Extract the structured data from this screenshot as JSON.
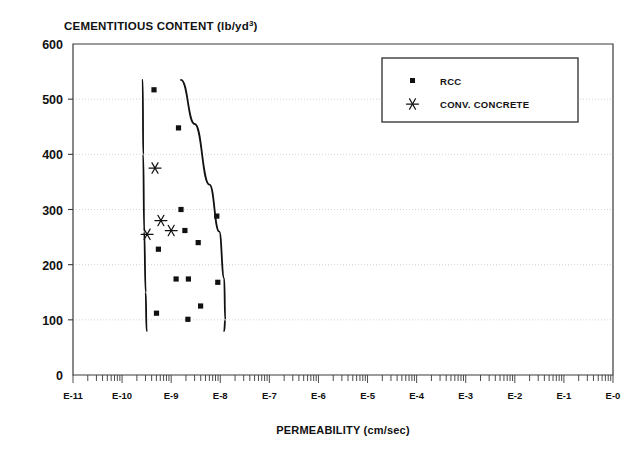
{
  "chart_data": {
    "type": "scatter",
    "title": "CEMENTITIOUS CONTENT (lb/yd3)",
    "title_main": "CEMENTITIOUS CONTENT (lb/yd",
    "title_sup": "3",
    "title_tail": ")",
    "xlabel": "PERMEABILITY (cm/sec)",
    "ylabel": "CEMENTITIOUS CONTENT (lb/yd3)",
    "xscale": "log",
    "yscale": "linear",
    "ylim": [
      0,
      600
    ],
    "xlim_exponent": [
      -11,
      0
    ],
    "grid": true,
    "grid_axis": "y",
    "legend_position": "top-right",
    "y_ticks": [
      600,
      500,
      400,
      300,
      200,
      100,
      0
    ],
    "y_tick_labels": [
      "600",
      "500",
      "400",
      "300",
      "200",
      "100",
      "0"
    ],
    "x_ticks": [
      -11,
      -10,
      -9,
      -8,
      -7,
      -6,
      -5,
      -4,
      -3,
      -2,
      -1,
      0
    ],
    "x_tick_labels": [
      "E-11",
      "E-10",
      "E-9",
      "E-8",
      "E-7",
      "E-6",
      "E-5",
      "E-4",
      "E-3",
      "E-2",
      "E-1",
      "E-0"
    ],
    "series": [
      {
        "name": "RCC",
        "marker": "square",
        "color": "#111111",
        "points": [
          {
            "x_exponent": -9.35,
            "y": 517
          },
          {
            "x_exponent": -8.85,
            "y": 448
          },
          {
            "x_exponent": -8.8,
            "y": 300
          },
          {
            "x_exponent": -8.07,
            "y": 288
          },
          {
            "x_exponent": -8.72,
            "y": 262
          },
          {
            "x_exponent": -8.45,
            "y": 240
          },
          {
            "x_exponent": -9.26,
            "y": 228
          },
          {
            "x_exponent": -8.9,
            "y": 174
          },
          {
            "x_exponent": -8.65,
            "y": 174
          },
          {
            "x_exponent": -8.05,
            "y": 168
          },
          {
            "x_exponent": -8.4,
            "y": 125
          },
          {
            "x_exponent": -9.3,
            "y": 112
          },
          {
            "x_exponent": -8.66,
            "y": 101
          }
        ]
      },
      {
        "name": "CONV. CONCRETE",
        "marker": "asterisk",
        "color": "#111111",
        "points": [
          {
            "x_exponent": -9.33,
            "y": 375
          },
          {
            "x_exponent": -9.21,
            "y": 280
          },
          {
            "x_exponent": -9.0,
            "y": 262
          },
          {
            "x_exponent": -9.49,
            "y": 255
          }
        ]
      }
    ],
    "envelope_curves": [
      {
        "name": "left-boundary",
        "points": [
          {
            "x_exponent": -9.58,
            "y": 535
          },
          {
            "x_exponent": -9.57,
            "y": 400
          },
          {
            "x_exponent": -9.55,
            "y": 260
          },
          {
            "x_exponent": -9.52,
            "y": 150
          },
          {
            "x_exponent": -9.5,
            "y": 80
          }
        ]
      },
      {
        "name": "right-boundary",
        "points": [
          {
            "x_exponent": -8.8,
            "y": 535
          },
          {
            "x_exponent": -8.52,
            "y": 455
          },
          {
            "x_exponent": -8.22,
            "y": 345
          },
          {
            "x_exponent": -8.02,
            "y": 260
          },
          {
            "x_exponent": -7.92,
            "y": 175
          },
          {
            "x_exponent": -7.9,
            "y": 100
          },
          {
            "x_exponent": -7.92,
            "y": 80
          }
        ]
      }
    ],
    "legend": {
      "entries": [
        {
          "label": "RCC",
          "marker": "square"
        },
        {
          "label": "CONV. CONCRETE",
          "marker": "asterisk"
        }
      ]
    }
  }
}
